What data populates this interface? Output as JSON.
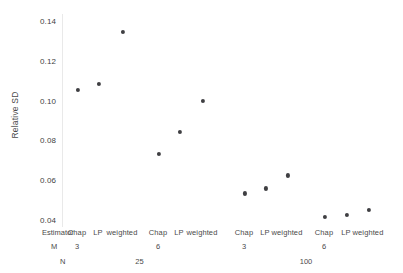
{
  "chart_data": {
    "type": "scatter",
    "title": "",
    "xlabel": "",
    "ylabel": "Relative SD",
    "ylim": [
      0.03,
      0.145
    ],
    "yticks": [
      "0.04",
      "0.06",
      "0.08",
      "0.10",
      "0.12",
      "0.14"
    ],
    "ytick_values": [
      0.04,
      0.06,
      0.08,
      0.1,
      0.12,
      0.14
    ],
    "grid": false,
    "legend": "none",
    "marker_color": "#3f3f42",
    "axis_keys": {
      "estimator": "Estimator",
      "m": "M",
      "n": "N"
    },
    "categories": [
      "Chap",
      "LP",
      "weighted",
      "Chap",
      "LP",
      "weighted",
      "Chap",
      "LP",
      "weighted",
      "Chap",
      "LP",
      "weighted"
    ],
    "values": [
      0.1053,
      0.1083,
      0.1347,
      0.0731,
      0.0842,
      0.0998,
      0.0534,
      0.0559,
      0.0624,
      0.0415,
      0.0427,
      0.0452
    ],
    "groups_m": [
      {
        "label": "3",
        "span_start": 0,
        "span_end": 2
      },
      {
        "label": "6",
        "span_start": 3,
        "span_end": 5
      },
      {
        "label": "3",
        "span_start": 6,
        "span_end": 8
      },
      {
        "label": "6",
        "span_start": 9,
        "span_end": 11
      }
    ],
    "groups_n": [
      {
        "label": "25",
        "span_start": 0,
        "span_end": 5
      },
      {
        "label": "100",
        "span_start": 6,
        "span_end": 11
      }
    ]
  }
}
